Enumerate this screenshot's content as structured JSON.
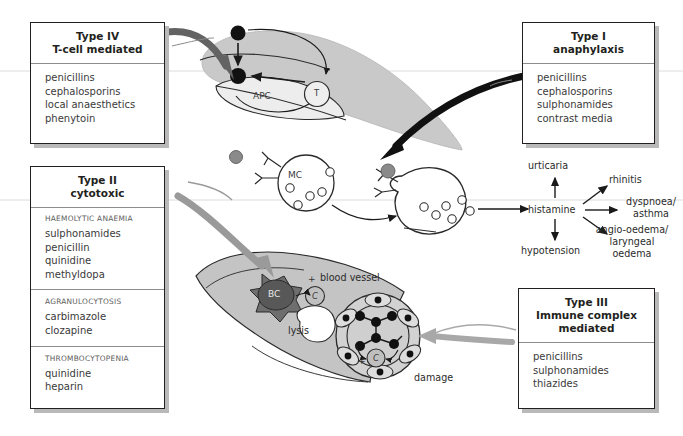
{
  "figure": {
    "background": "#ffffff"
  },
  "colors": {
    "ink": "#231f20",
    "box_border": "#231f20",
    "box_shadow": "#b9b9b9",
    "cell_fill": "#c9c9c9",
    "cell_fill_light": "#d6d6d6",
    "vessel_fill": "#c4c4c4",
    "bc_fill": "#6e6e6e",
    "antigen_dark": "#111111",
    "antigen_gray": "#8a8a8a",
    "arrow_type4": "#636363",
    "arrow_type1": "#111111",
    "arrow_type2": "#9a9a9a",
    "arrow_type3": "#a8a8a8",
    "rule_faint": "#d8d8d8"
  },
  "boxes": {
    "type4": {
      "title_line1": "Type IV",
      "title_line2": "T-cell mediated",
      "drugs": [
        "penicillins",
        "cephalosporins",
        "local anaesthetics",
        "phenytoin"
      ]
    },
    "type1": {
      "title_line1": "Type I",
      "title_line2": "anaphylaxis",
      "drugs": [
        "penicillins",
        "cephalosporins",
        "sulphonamides",
        "contrast media"
      ]
    },
    "type2": {
      "title_line1": "Type II",
      "title_line2": "cytotoxic",
      "sections": [
        {
          "heading": "HAEMOLYTIC ANAEMIA",
          "drugs": [
            "sulphonamides",
            "penicillin",
            "quinidine",
            "methyldopa"
          ]
        },
        {
          "heading": "AGRANULOCYTOSIS",
          "drugs": [
            "carbimazole",
            "clozapine"
          ]
        },
        {
          "heading": "THROMBOCYTOPENIA",
          "drugs": [
            "quinidine",
            "heparin"
          ]
        }
      ]
    },
    "type3": {
      "title_line1": "Type III",
      "title_line2": "Immune complex",
      "title_line3": "mediated",
      "drugs": [
        "penicillins",
        "sulphonamides",
        "thiazides"
      ]
    }
  },
  "cells": {
    "apc_label": "APC",
    "tcell_label": "T",
    "mast_cell_label": "MC",
    "blood_cell_label": "BC",
    "complement_label": "C",
    "complement_label2": "C"
  },
  "annotations": {
    "blood_vessel": "blood vessel",
    "lysis": "lysis",
    "damage": "damage",
    "plus1": "+",
    "plus2": "+"
  },
  "mediator_chain": {
    "center": "histamine",
    "outcomes": [
      {
        "id": "urticaria",
        "label": "urticaria"
      },
      {
        "id": "rhinitis",
        "label": "rhinitis"
      },
      {
        "id": "dyspnoea-asthma",
        "label": "dyspnoea/\nasthma",
        "line1": "dyspnoea/",
        "line2": "asthma"
      },
      {
        "id": "angio-oedema",
        "label": "angio-oedema/ laryngeal oedema",
        "line1": "angio-oedema/",
        "line2": "laryngeal",
        "line3": "oedema"
      },
      {
        "id": "hypotension",
        "label": "hypotension"
      }
    ]
  }
}
